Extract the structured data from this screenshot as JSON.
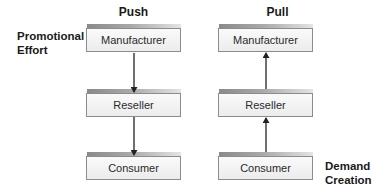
{
  "diagram": {
    "columns": [
      {
        "title": "Push",
        "nodes": [
          "Manufacturer",
          "Reseller",
          "Consumer"
        ],
        "arrow_direction": "down"
      },
      {
        "title": "Pull",
        "nodes": [
          "Manufacturer",
          "Reseller",
          "Consumer"
        ],
        "arrow_direction": "up"
      }
    ],
    "labels": {
      "promotional_effort": [
        "Promotional",
        "Effort"
      ],
      "demand_creation": [
        "Demand",
        "Creation"
      ]
    },
    "colors": {
      "text": "#1a1a1a",
      "box_border": "#8c8c8c",
      "box_fill": "#f2f2f2",
      "arrow": "#222222"
    }
  }
}
